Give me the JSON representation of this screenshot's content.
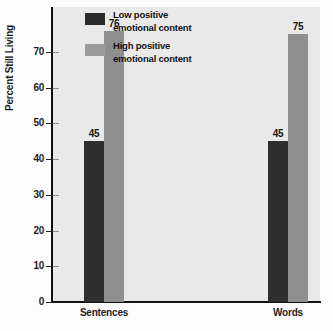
{
  "chart_data": {
    "type": "bar",
    "title": "",
    "subtitle": "",
    "xlabel": "",
    "ylabel": "Percent Still Living",
    "categories": [
      "Sentences",
      "Words"
    ],
    "series": [
      {
        "name": "Low positive emotional content",
        "name_line1": "Low positive",
        "name_line2": "emotional content",
        "color": "#2e2e2e",
        "values": [
          45,
          45
        ],
        "value_labels": [
          "45",
          "45"
        ]
      },
      {
        "name": "High positive emotional content",
        "name_line1": "High positive",
        "name_line2": "emotional content",
        "color": "#8f8f8f",
        "values": [
          76,
          75
        ],
        "value_labels": [
          "76",
          "75"
        ]
      }
    ],
    "ylim": [
      0,
      78
    ],
    "yticks": [
      0,
      10,
      20,
      30,
      40,
      50,
      60,
      70
    ],
    "ytick_labels": [
      "0",
      "10",
      "20",
      "30",
      "40",
      "50",
      "60",
      "70"
    ],
    "grid": false,
    "legend_position": "top-center",
    "plot_background": "#e9e9e9",
    "figure_background": "#fdfdfd",
    "axis_color": "#111111"
  },
  "axis": {
    "ylabel": "Percent Still Living",
    "ticks": [
      {
        "value": "70",
        "num": 70
      },
      {
        "value": "60",
        "num": 60
      },
      {
        "value": "50",
        "num": 50
      },
      {
        "value": "40",
        "num": 40
      },
      {
        "value": "30",
        "num": 30
      },
      {
        "value": "20",
        "num": 20
      },
      {
        "value": "10",
        "num": 10
      },
      {
        "value": "0",
        "num": 0
      }
    ]
  },
  "categories": [
    {
      "label": "Sentences"
    },
    {
      "label": "Words"
    }
  ],
  "legend": {
    "items": [
      {
        "line1": "Low positive",
        "line2": "emotional content",
        "color": "#2e2e2e"
      },
      {
        "line1": "High positive",
        "line2": "emotional content",
        "color": "#8f8f8f"
      }
    ]
  },
  "bars": [
    {
      "group": "Sentences",
      "series": "low",
      "label": "45"
    },
    {
      "group": "Sentences",
      "series": "high",
      "label": "76"
    },
    {
      "group": "Words",
      "series": "low",
      "label": "45"
    },
    {
      "group": "Words",
      "series": "high",
      "label": "75"
    }
  ]
}
